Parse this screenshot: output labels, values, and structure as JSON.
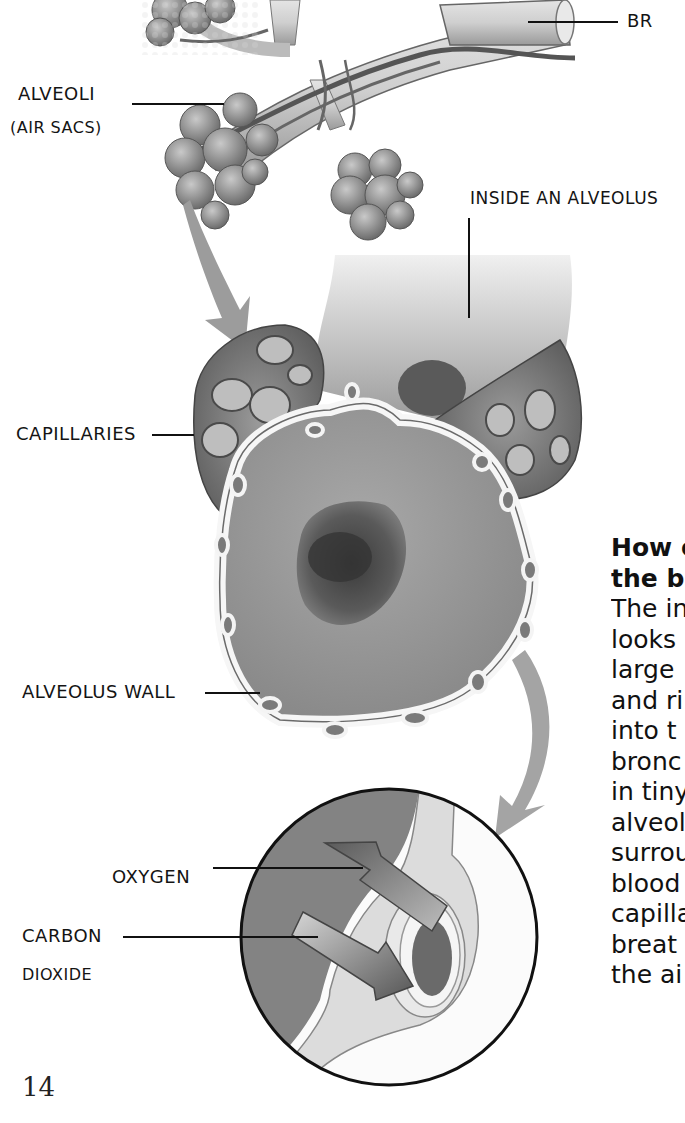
{
  "figure": {
    "labels": {
      "bronchiole": "BR",
      "alveoli": "ALVEOLI",
      "alveoli_sub": "(AIR SACS)",
      "inside_alveolus": "INSIDE AN ALVEOLUS",
      "capillaries": "CAPILLARIES",
      "alveolus_wall": "ALVEOLUS WALL",
      "oxygen": "OXYGEN",
      "carbon": "CARBON",
      "carbon_sub": "DIOXIDE"
    },
    "colors": {
      "tissue_dark": "#5a5a5a",
      "tissue_mid": "#8c8c8c",
      "tissue_light": "#c8c8c8",
      "wall": "#f4f4f4",
      "arrow_grey": "#9a9a9a"
    }
  },
  "sidebar_text": {
    "heading_line1": "How o",
    "heading_line2": "the bl",
    "lines": [
      "The in",
      "looks",
      "large",
      "and ri",
      "into t",
      "bronc",
      "in tiny",
      "alveol",
      "surrou",
      "blood",
      "capilla",
      "breat",
      "the ai"
    ]
  },
  "page": {
    "number": "14"
  }
}
